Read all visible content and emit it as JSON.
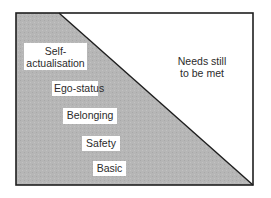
{
  "diagram": {
    "type": "needs-hierarchy-triangle",
    "colors": {
      "filled_region": "#b4b4b4",
      "unfilled_region": "#ffffff",
      "border": "#1e1e1e",
      "label_background": "#ffffff"
    },
    "filled_levels": [
      {
        "lines": [
          "Self-",
          "actualisation"
        ]
      },
      {
        "lines": [
          "Ego-status"
        ]
      },
      {
        "lines": [
          "Belonging"
        ]
      },
      {
        "lines": [
          "Safety"
        ]
      },
      {
        "lines": [
          "Basic"
        ]
      }
    ],
    "unfilled_region_label": {
      "lines": [
        "Needs still",
        "to be met"
      ]
    }
  }
}
